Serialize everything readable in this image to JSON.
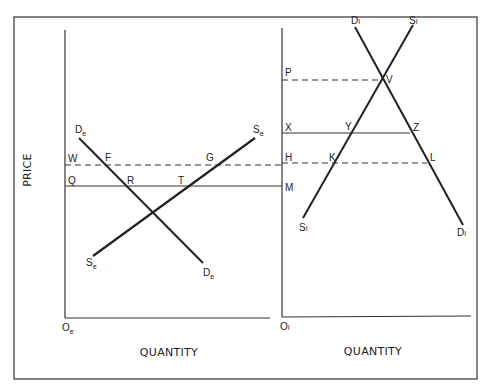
{
  "diagram": {
    "type": "supply-demand-two-panel",
    "y_axis_label": "PRICE",
    "left_panel": {
      "x_axis_label": "QUANTITY",
      "origin": {
        "label": "O",
        "sub": "e"
      },
      "price_levels": [
        {
          "label": "W",
          "style": "dashed"
        },
        {
          "label": "Q",
          "style": "solid"
        }
      ],
      "curves": [
        {
          "name": "demand",
          "label": "D",
          "sub": "e"
        },
        {
          "name": "supply",
          "label": "S",
          "sub": "e"
        }
      ],
      "points": [
        "F",
        "G",
        "R",
        "T"
      ]
    },
    "right_panel": {
      "x_axis_label": "QUANTITY",
      "origin": {
        "label": "O",
        "sub": "I"
      },
      "price_levels": [
        {
          "label": "P",
          "style": "dashed"
        },
        {
          "label": "X",
          "style": "solid"
        },
        {
          "label": "H",
          "style": "dashed"
        },
        {
          "label": "M",
          "style": "solid"
        }
      ],
      "curves": [
        {
          "name": "demand",
          "label": "D",
          "sub": "I"
        },
        {
          "name": "supply",
          "label": "S",
          "sub": "I"
        }
      ],
      "points": [
        "V",
        "Y",
        "Z",
        "K",
        "L"
      ]
    }
  },
  "labels": {
    "price": "PRICE",
    "quantity_left": "QUANTITY",
    "quantity_right": "QUANTITY",
    "W": "W",
    "Q": "Q",
    "F": "F",
    "G": "G",
    "R": "R",
    "T": "T",
    "P": "P",
    "X": "X",
    "H": "H",
    "M": "M",
    "V": "V",
    "Y": "Y",
    "Z": "Z",
    "K": "K",
    "L": "L",
    "De": "D",
    "De_sub": "e",
    "Se": "S",
    "Se_sub": "e",
    "Di": "D",
    "Di_sub": "I",
    "Si": "S",
    "Si_sub": "I",
    "Oe": "O",
    "Oe_sub": "e",
    "Oi": "O",
    "Oi_sub": "I"
  }
}
